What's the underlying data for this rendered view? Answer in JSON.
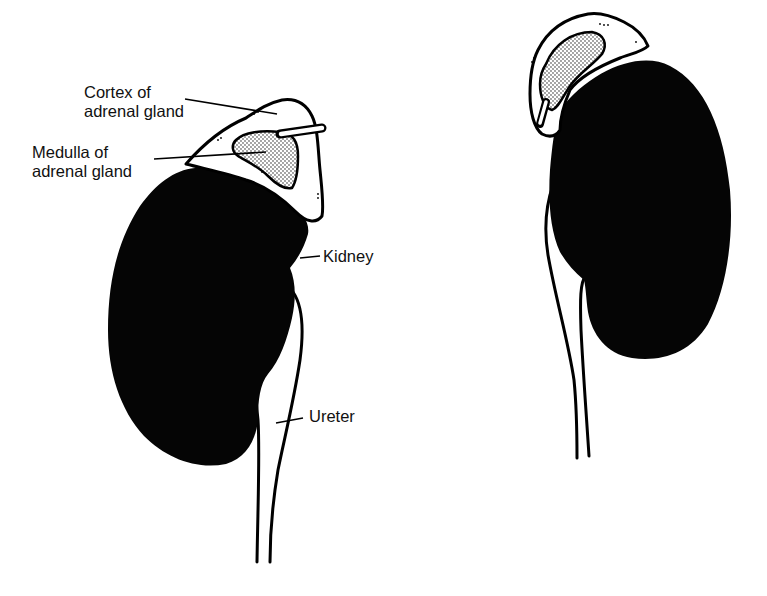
{
  "diagram": {
    "type": "anatomical-illustration",
    "colors": {
      "kidney_fill": "#050505",
      "outline": "#000000",
      "gland_fill": "#ffffff",
      "medulla_stipple": "#000000",
      "background": "#ffffff"
    },
    "labels": {
      "cortex_line1": "Cortex of",
      "cortex_line2": "adrenal gland",
      "medulla_line1": "Medulla of",
      "medulla_line2": "adrenal gland",
      "kidney": "Kidney",
      "ureter": "Ureter"
    },
    "views": [
      {
        "name": "left-view",
        "labeled": true
      },
      {
        "name": "right-view",
        "labeled": false
      }
    ]
  }
}
